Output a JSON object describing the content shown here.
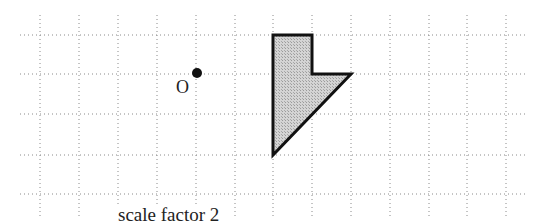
{
  "diagram": {
    "type": "enlargement",
    "grid": {
      "spacing_px": 39,
      "vertical_x": [
        40,
        79,
        118,
        157,
        196,
        235,
        273,
        312,
        351,
        390,
        429,
        467,
        506
      ],
      "horizontal_y": [
        35,
        74,
        114,
        155,
        194
      ],
      "x_extent": [
        20,
        525
      ],
      "y_extent": [
        15,
        218
      ],
      "color": "#8a8a8a"
    },
    "centre": {
      "label": "O",
      "x": 197,
      "y": 73,
      "label_x": 176,
      "label_y": 93
    },
    "shape": {
      "points": "273,35 312,35 312,74 351,74 273,155",
      "fill": "#c8c8c8",
      "stroke": "#111111"
    },
    "caption": {
      "text": "scale factor 2",
      "x": 118,
      "y": 223
    }
  }
}
